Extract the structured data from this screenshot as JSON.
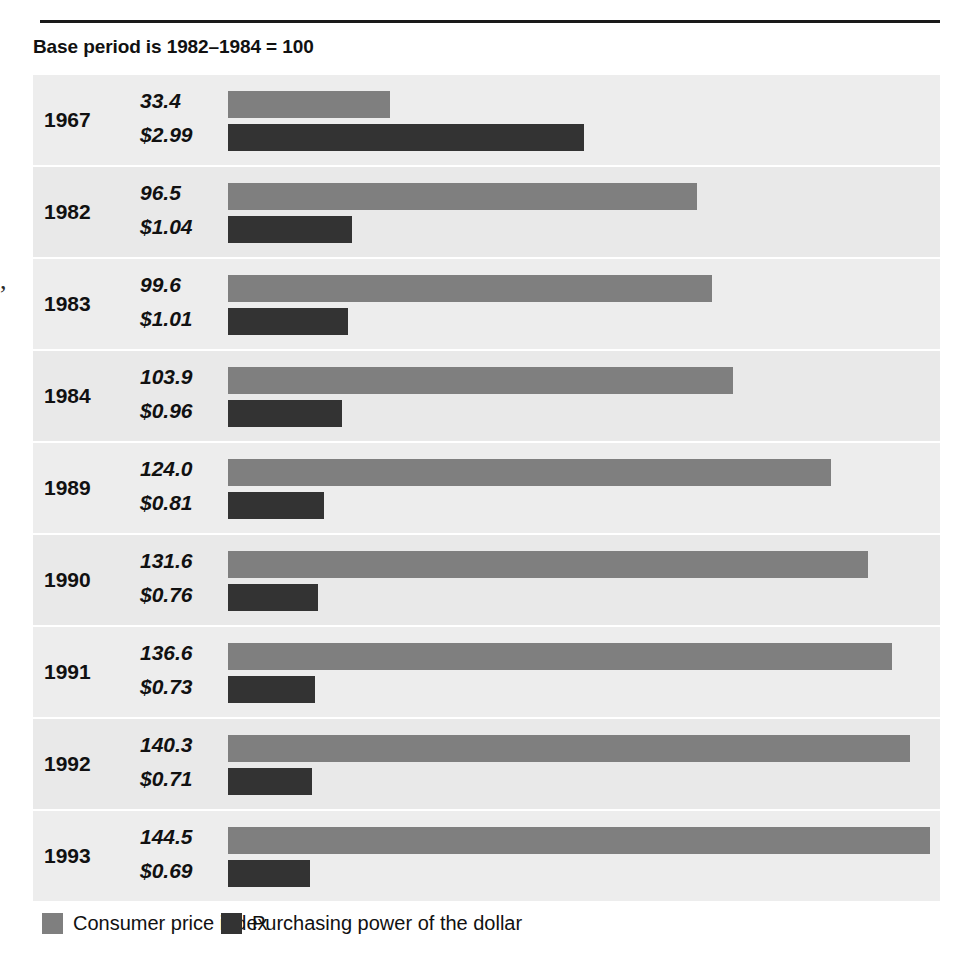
{
  "header": {
    "rule": "horizontal-rule",
    "subtitle": "Base period is 1982–1984 = 100"
  },
  "margin_fragment": ",",
  "chart_data": {
    "type": "bar",
    "orientation": "horizontal-grouped",
    "title": "",
    "subtitle": "Base period is 1982–1984 = 100",
    "xlabel": "",
    "ylabel": "",
    "categories": [
      "1967",
      "1982",
      "1983",
      "1984",
      "1989",
      "1990",
      "1991",
      "1992",
      "1993"
    ],
    "series": [
      {
        "name": "Consumer price index",
        "color": "#7f7f7f",
        "values": [
          33.4,
          96.5,
          99.6,
          103.9,
          124.0,
          131.6,
          136.6,
          140.3,
          144.5
        ],
        "labels": [
          "33.4",
          "96.5",
          "99.6",
          "103.9",
          "124.0",
          "131.6",
          "136.6",
          "140.3",
          "144.5"
        ],
        "axis_max": 144.5
      },
      {
        "name": "Purchasing power of the dollar",
        "color": "#333333",
        "values": [
          2.99,
          1.04,
          1.01,
          0.96,
          0.81,
          0.76,
          0.73,
          0.71,
          0.69
        ],
        "labels": [
          "$2.99",
          "$1.04",
          "$1.01",
          "$0.96",
          "$0.81",
          "$0.76",
          "$0.73",
          "$0.71",
          "$0.69"
        ],
        "axis_max": 2.99
      }
    ],
    "grid": false,
    "legend_position": "bottom"
  },
  "rows": [
    {
      "year": "1967",
      "cpi_label": "33.4",
      "ppd_label": "$2.99",
      "cpi_value": 33.4,
      "ppd_value": 2.99
    },
    {
      "year": "1982",
      "cpi_label": "96.5",
      "ppd_label": "$1.04",
      "cpi_value": 96.5,
      "ppd_value": 1.04
    },
    {
      "year": "1983",
      "cpi_label": "99.6",
      "ppd_label": "$1.01",
      "cpi_value": 99.6,
      "ppd_value": 1.01
    },
    {
      "year": "1984",
      "cpi_label": "103.9",
      "ppd_label": "$0.96",
      "cpi_value": 103.9,
      "ppd_value": 0.96
    },
    {
      "year": "1989",
      "cpi_label": "124.0",
      "ppd_label": "$0.81",
      "cpi_value": 124.0,
      "ppd_value": 0.81
    },
    {
      "year": "1990",
      "cpi_label": "131.6",
      "ppd_label": "$0.76",
      "cpi_value": 131.6,
      "ppd_value": 0.76
    },
    {
      "year": "1991",
      "cpi_label": "136.6",
      "ppd_label": "$0.73",
      "cpi_value": 136.6,
      "ppd_value": 0.73
    },
    {
      "year": "1992",
      "cpi_label": "140.3",
      "ppd_label": "$0.71",
      "cpi_value": 140.3,
      "ppd_value": 0.71
    },
    {
      "year": "1993",
      "cpi_label": "144.5",
      "ppd_label": "$0.69",
      "cpi_value": 144.5,
      "ppd_value": 0.69
    }
  ],
  "legend": {
    "items": [
      {
        "label": "Consumer price index",
        "color": "#7f7f7f",
        "swatch": "cpi"
      },
      {
        "label": "Purchasing power of the dollar",
        "color": "#333333",
        "swatch": "ppd"
      }
    ]
  },
  "colors": {
    "cpi_bar": "#7f7f7f",
    "ppd_bar": "#333333",
    "row_band": "#ededed",
    "row_band_alt": "#e9e9e9",
    "page_background": "#ffffff",
    "rule": "#1a1a1a",
    "text": "#111111"
  },
  "scale": {
    "bar_origin_px": 195,
    "cpi_px_per_unit": 4.86,
    "ppd_px_per_dollar": 119.0,
    "row_height_px": 90,
    "row_gap_px": 2
  }
}
